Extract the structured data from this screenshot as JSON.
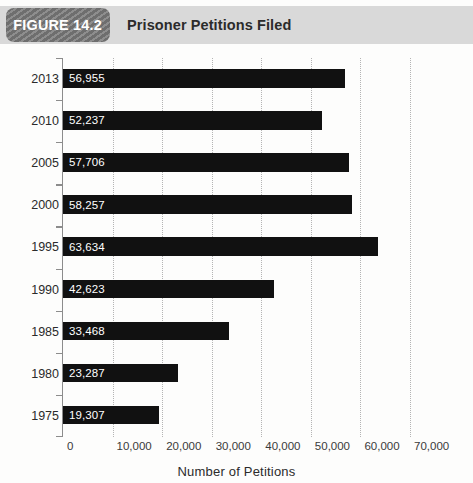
{
  "header": {
    "badge_label": "FIGURE 14.2",
    "title": "Prisoner Petitions Filed",
    "badge_color": "#6e6e6e",
    "bar_color": "#d9d9d9"
  },
  "chart_data": {
    "type": "bar",
    "orientation": "horizontal",
    "title": "Prisoner Petitions Filed",
    "xlabel": "Number of Petitions",
    "ylabel": "",
    "categories": [
      "2013",
      "2010",
      "2005",
      "2000",
      "1995",
      "1990",
      "1985",
      "1980",
      "1975"
    ],
    "values": [
      56955,
      52237,
      57706,
      58257,
      63634,
      42623,
      33468,
      23287,
      19307
    ],
    "value_labels": [
      "56,955",
      "52,237",
      "57,706",
      "58,257",
      "63,634",
      "42,623",
      "33,468",
      "23,287",
      "19,307"
    ],
    "xlim": [
      0,
      70000
    ],
    "xticks": [
      0,
      10000,
      20000,
      30000,
      40000,
      50000,
      60000,
      70000
    ],
    "xtick_labels": [
      "0",
      "10,000",
      "20,000",
      "30,000",
      "40,000",
      "50,000",
      "60,000",
      "70,000"
    ],
    "grid": "vertical-dotted",
    "legend": null,
    "series_color": "#111111",
    "gridline_color": "#b4b4b4"
  }
}
